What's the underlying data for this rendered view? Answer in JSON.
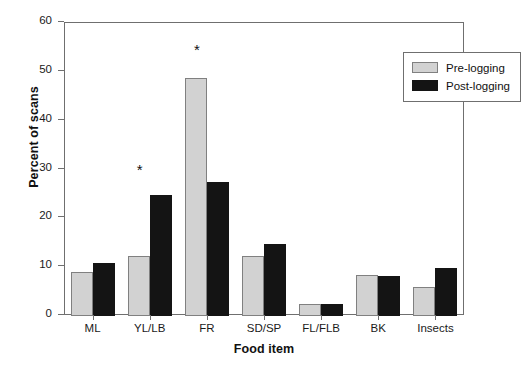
{
  "chart_data": {
    "type": "bar",
    "title": "",
    "xlabel": "Food item",
    "ylabel": "Percent of scans",
    "categories": [
      "ML",
      "YL/LB",
      "FR",
      "SD/SP",
      "FL/FLB",
      "BK",
      "Insects"
    ],
    "series": [
      {
        "name": "Pre-logging",
        "color": "#d2d2d2",
        "values": [
          9.1,
          12.3,
          48.8,
          12.3,
          2.5,
          8.3,
          6.0
        ]
      },
      {
        "name": "Post-logging",
        "color": "#141414",
        "values": [
          10.9,
          24.7,
          27.4,
          14.7,
          2.4,
          8.2,
          9.8
        ]
      }
    ],
    "ylim": [
      0,
      60
    ],
    "yticks": [
      0,
      10,
      20,
      30,
      40,
      50,
      60
    ],
    "ytick_labels": [
      "0",
      "10",
      "20",
      "30",
      "40",
      "50",
      "60"
    ],
    "grid": false,
    "legend_position": "top-right",
    "annotations": [
      {
        "text": "*",
        "category": "YL/LB",
        "y": 31.0
      },
      {
        "text": "*",
        "category": "FR",
        "y": 55.5
      }
    ]
  },
  "legend": {
    "items": [
      {
        "label": "Pre-logging"
      },
      {
        "label": "Post-logging"
      }
    ]
  },
  "caption": {
    "fragment": ""
  }
}
